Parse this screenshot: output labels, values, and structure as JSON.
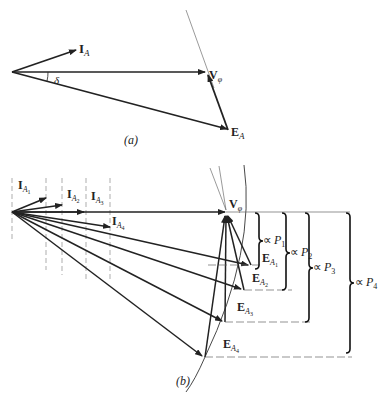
{
  "figure_a": {
    "caption": "(a)",
    "labels": {
      "current": {
        "main": "I",
        "sub": "A"
      },
      "voltage": {
        "main": "V",
        "sub": "φ"
      },
      "emf": {
        "main": "E",
        "sub": "A"
      },
      "angle": "δ"
    }
  },
  "figure_b": {
    "caption": "(b)",
    "voltage": {
      "main": "V",
      "sub": "φ"
    },
    "currents": [
      {
        "main": "I",
        "sub": "A",
        "subsub": "1"
      },
      {
        "main": "I",
        "sub": "A",
        "subsub": "2"
      },
      {
        "main": "I",
        "sub": "A",
        "subsub": "3"
      },
      {
        "main": "I",
        "sub": "A",
        "subsub": "4"
      }
    ],
    "emfs": [
      {
        "main": "E",
        "sub": "A",
        "subsub": "1"
      },
      {
        "main": "E",
        "sub": "A",
        "subsub": "2"
      },
      {
        "main": "E",
        "sub": "A",
        "subsub": "3"
      },
      {
        "main": "E",
        "sub": "A",
        "subsub": "4"
      }
    ],
    "powers": [
      {
        "prefix": "∝",
        "main": "P",
        "sub": "1"
      },
      {
        "prefix": "∝",
        "main": "P",
        "sub": "2"
      },
      {
        "prefix": "∝",
        "main": "P",
        "sub": "3"
      },
      {
        "prefix": "∝",
        "main": "P",
        "sub": "4"
      }
    ]
  }
}
